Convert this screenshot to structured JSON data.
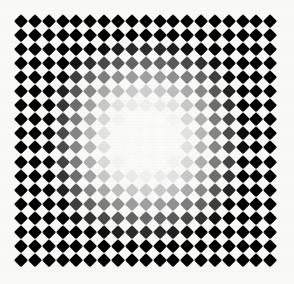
{
  "plate": {
    "title": "Radial Gradient Diamond Checkerboard",
    "type": "optical-illusion-pattern",
    "caption": ""
  },
  "chart_data": {
    "type": "heatmap",
    "subtitle": "",
    "xlabel": "",
    "ylabel": "",
    "legend": [],
    "grid": false,
    "columns": 19,
    "rows": 18,
    "origin_x": 21.0,
    "origin_y": 21.0,
    "pitch_x": 13.85,
    "pitch_y": 14.05,
    "tile_size": 9.6,
    "tile_rotation_deg": 45,
    "center_col": 9,
    "center_row": 8.5,
    "background_color": "#f9f9f8",
    "edge_color": "#000000",
    "center_color": "#ffffff",
    "falloff": {
      "model": "normalized-radial-ramp",
      "plateau_radius": 0.22,
      "black_radius": 0.8,
      "gamma": 1.35
    },
    "value_range": [
      0,
      255
    ],
    "sampled_values": {
      "corner_tile": 8,
      "edge_mid_tile": 10,
      "ring_4_tile": 48,
      "ring_6_tile": 105,
      "ring_8_tile": 168,
      "ring_10_tile": 214,
      "ring_12_tile": 240,
      "center_tile": 253
    }
  }
}
